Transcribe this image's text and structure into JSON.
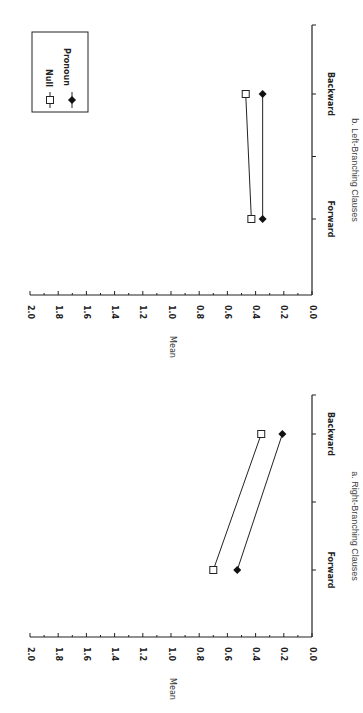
{
  "chart_data": [
    {
      "type": "line",
      "title": "a.  Right-Branching Clauses",
      "xlabel": "",
      "ylabel": "Mean",
      "ylim": [
        0.0,
        2.0
      ],
      "yticks": [
        "0.0",
        "0.2",
        "0.4",
        "0.6",
        "0.8",
        "1.0",
        "1.2",
        "1.4",
        "1.6",
        "1.8",
        "2.0"
      ],
      "categories": [
        "Forward",
        "Backward"
      ],
      "series": [
        {
          "name": "Null",
          "marker": "open-square",
          "values": [
            0.7,
            0.36
          ]
        },
        {
          "name": "Pronoun",
          "marker": "filled-diamond",
          "values": [
            0.53,
            0.21
          ]
        }
      ],
      "grid": false,
      "orientation": "rotated-90-clockwise"
    },
    {
      "type": "line",
      "title": "b.  Left-Branching Clauses",
      "xlabel": "",
      "ylabel": "Mean",
      "ylim": [
        0.0,
        2.0
      ],
      "yticks": [
        "0.0",
        "0.2",
        "0.4",
        "0.6",
        "0.8",
        "1.0",
        "1.2",
        "1.4",
        "1.6",
        "1.8",
        "2.0"
      ],
      "categories": [
        "Forward",
        "Backward"
      ],
      "series": [
        {
          "name": "Null",
          "marker": "open-square",
          "values": [
            0.43,
            0.47
          ]
        },
        {
          "name": "Pronoun",
          "marker": "filled-diamond",
          "values": [
            0.35,
            0.35
          ]
        }
      ],
      "legend": {
        "position": "upper-right",
        "entries": [
          "Null",
          "Pronoun"
        ]
      },
      "grid": false,
      "orientation": "rotated-90-clockwise"
    }
  ],
  "labels": {
    "caption_a": "a.  Right-Branching Clauses",
    "caption_b": "b.  Left-Branching Clauses",
    "ylabel": "Mean",
    "legend_null": "Null",
    "legend_pronoun": "Pronoun",
    "cat_forward": "Forward",
    "cat_backward": "Backward",
    "ticks": [
      "0.0",
      "0.2",
      "0.4",
      "0.6",
      "0.8",
      "1.0",
      "1.2",
      "1.4",
      "1.6",
      "1.8",
      "2.0"
    ]
  }
}
